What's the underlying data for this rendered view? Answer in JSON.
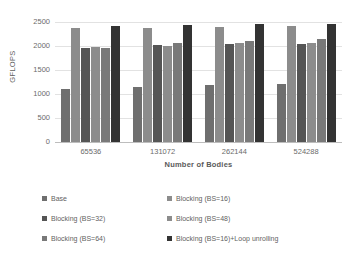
{
  "chart_data": {
    "type": "bar",
    "title": "",
    "xlabel": "Number of Bodies",
    "ylabel": "GFLOPS",
    "ylim": [
      0,
      2500
    ],
    "yticks": [
      0,
      500,
      1000,
      1500,
      2000,
      2500
    ],
    "grid": true,
    "legend_position": "bottom",
    "legend_columns": 2,
    "categories": [
      "65536",
      "131072",
      "262144",
      "524288"
    ],
    "series": [
      {
        "name": "Base",
        "color": "#6f6f6f",
        "values": [
          1095,
          1140,
          1180,
          1215
        ]
      },
      {
        "name": "Blocking (BS=16)",
        "color": "#8c8c8c",
        "values": [
          2380,
          2380,
          2400,
          2420
        ]
      },
      {
        "name": "Blocking (BS=32)",
        "color": "#555555",
        "values": [
          1950,
          2030,
          2035,
          2050
        ]
      },
      {
        "name": "Blocking (BS=48)",
        "color": "#8c8c8c",
        "values": [
          1980,
          2010,
          2060,
          2060
        ]
      },
      {
        "name": "Blocking (BS=64)",
        "color": "#797979",
        "values": [
          1950,
          2065,
          2110,
          2145
        ]
      },
      {
        "name": "Blocking (BS=16)+Loop unrolling",
        "color": "#333333",
        "values": [
          2420,
          2440,
          2450,
          2455
        ]
      }
    ]
  }
}
